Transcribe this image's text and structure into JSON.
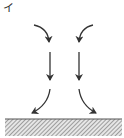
{
  "diagram": {
    "option_label": "イ",
    "colors": {
      "arrow": "#333333",
      "ground_fill": "#e6e6e6",
      "hatch": "#555555"
    },
    "arrows": [
      {
        "id": "left-top-curve",
        "path": "M34,25 Q48,28 49,42"
      },
      {
        "id": "right-top-curve",
        "path": "M93,25 Q80,28 79,42"
      },
      {
        "id": "left-straight",
        "path": "M50,52 L50,80"
      },
      {
        "id": "right-straight",
        "path": "M79,52 L79,80"
      },
      {
        "id": "left-bottom-curve",
        "path": "M50,89 Q48,105 32,113"
      },
      {
        "id": "right-bottom-curve",
        "path": "M79,89 Q81,105 96,113"
      }
    ],
    "ground": {
      "x": 5,
      "y": 119,
      "width": 117,
      "height": 17
    }
  }
}
